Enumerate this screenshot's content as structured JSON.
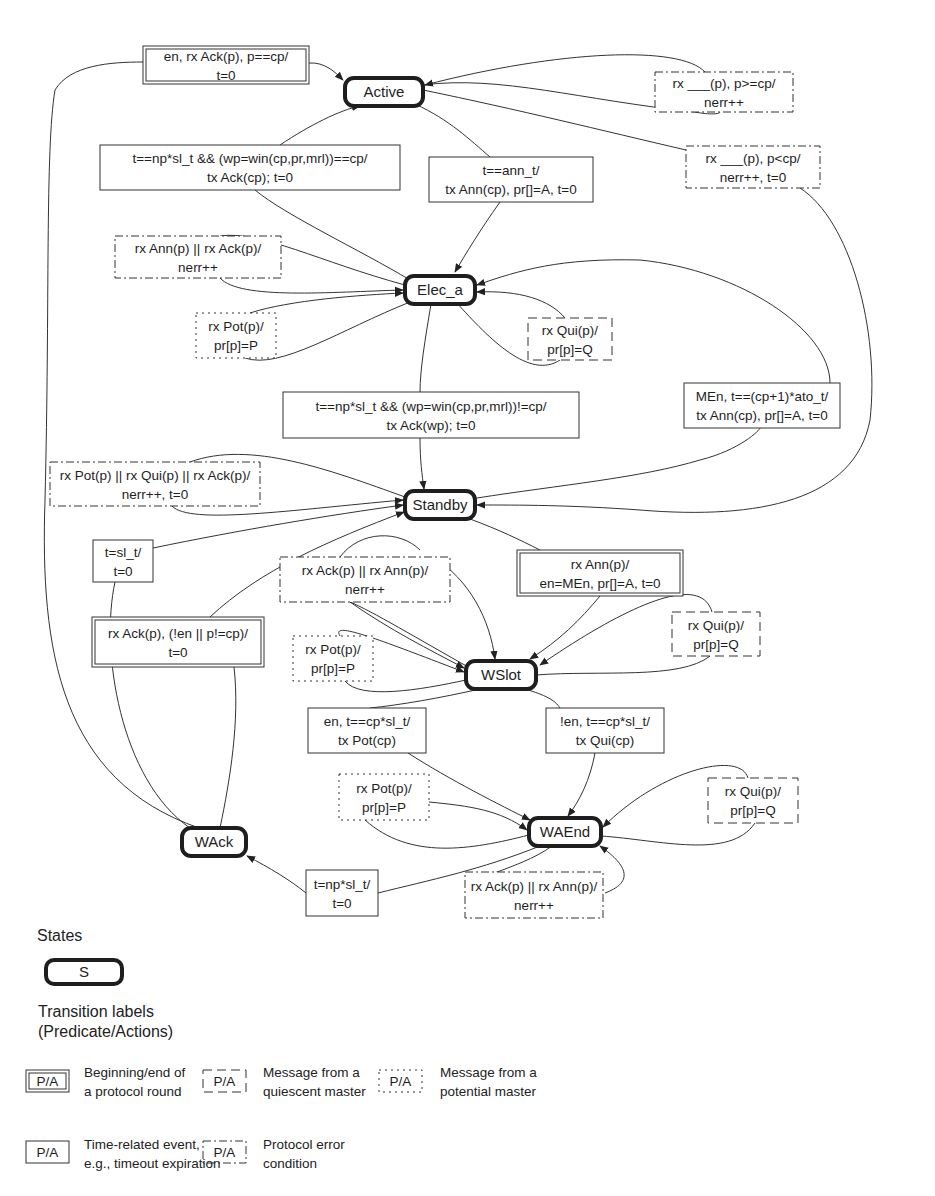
{
  "states": [
    {
      "id": "active",
      "label": "Active",
      "x": 345,
      "y": 78,
      "w": 78,
      "h": 28
    },
    {
      "id": "elec_a",
      "label": "Elec_a",
      "x": 405,
      "y": 276,
      "w": 70,
      "h": 28
    },
    {
      "id": "standby",
      "label": "Standby",
      "x": 405,
      "y": 491,
      "w": 70,
      "h": 28
    },
    {
      "id": "wslot",
      "label": "WSlot",
      "x": 466,
      "y": 661,
      "w": 70,
      "h": 28
    },
    {
      "id": "wack",
      "label": "WAck",
      "x": 182,
      "y": 828,
      "w": 64,
      "h": 28
    },
    {
      "id": "waend",
      "label": "WAEnd",
      "x": 529,
      "y": 818,
      "w": 72,
      "h": 28
    }
  ],
  "labels": [
    {
      "id": "en-rx-ack",
      "style": "double",
      "x": 143,
      "y": 46,
      "w": 166,
      "h": 38,
      "lines": [
        "en, rx Ack(p), p==cp/",
        "t=0"
      ]
    },
    {
      "id": "rx-p-ge-cp",
      "style": "dashdot",
      "x": 655,
      "y": 72,
      "w": 138,
      "h": 40,
      "lines": [
        "rx ___(p), p>=cp/",
        "nerr++"
      ]
    },
    {
      "id": "win-eq-cp",
      "style": "solid",
      "x": 100,
      "y": 145,
      "w": 300,
      "h": 45,
      "lines": [
        "t==np*sl_t && (wp=win(cp,pr,mrl))==cp/",
        "tx Ack(cp); t=0"
      ]
    },
    {
      "id": "ann-t",
      "style": "solid",
      "x": 429,
      "y": 157,
      "w": 164,
      "h": 45,
      "lines": [
        "t==ann_t/",
        "tx Ann(cp), pr[]=A, t=0"
      ]
    },
    {
      "id": "rx-p-lt-cp",
      "style": "dashdot",
      "x": 686,
      "y": 146,
      "w": 134,
      "h": 42,
      "lines": [
        "rx ___(p), p<cp/",
        "nerr++, t=0"
      ]
    },
    {
      "id": "ann-or-ack",
      "style": "dashdot",
      "x": 115,
      "y": 236,
      "w": 166,
      "h": 42,
      "lines": [
        "rx Ann(p) || rx Ack(p)/",
        "nerr++"
      ]
    },
    {
      "id": "pot-elec",
      "style": "dotted",
      "x": 196,
      "y": 313,
      "w": 80,
      "h": 45,
      "lines": [
        "rx Pot(p)/",
        "pr[p]=P"
      ]
    },
    {
      "id": "qui-elec",
      "style": "dashed",
      "x": 528,
      "y": 318,
      "w": 84,
      "h": 42,
      "lines": [
        "rx Qui(p)/",
        "pr[p]=Q"
      ]
    },
    {
      "id": "win-ne-cp",
      "style": "solid",
      "x": 283,
      "y": 392,
      "w": 296,
      "h": 46,
      "lines": [
        "t==np*sl_t && (wp=win(cp,pr,mrl))!=cp/",
        "tx Ack(wp); t=0"
      ]
    },
    {
      "id": "men-ato",
      "style": "solid",
      "x": 684,
      "y": 383,
      "w": 156,
      "h": 45,
      "lines": [
        "MEn, t==(cp+1)*ato_t/",
        "tx Ann(cp), pr[]=A, t=0"
      ]
    },
    {
      "id": "pot-qui-ack",
      "style": "dashdot",
      "x": 50,
      "y": 462,
      "w": 210,
      "h": 44,
      "lines": [
        "rx Pot(p) || rx Qui(p) || rx Ack(p)/",
        "nerr++, t=0"
      ]
    },
    {
      "id": "sl-t",
      "style": "solid",
      "x": 93,
      "y": 540,
      "w": 60,
      "h": 42,
      "lines": [
        "t=sl_t/",
        "t=0"
      ]
    },
    {
      "id": "rx-ann",
      "style": "double",
      "x": 517,
      "y": 550,
      "w": 166,
      "h": 46,
      "lines": [
        "rx Ann(p)/",
        "en=MEn, pr[]=A, t=0"
      ]
    },
    {
      "id": "ack-ann-wslot",
      "style": "dashdot",
      "x": 280,
      "y": 557,
      "w": 170,
      "h": 45,
      "lines": [
        "rx Ack(p) || rx Ann(p)/",
        "nerr++"
      ]
    },
    {
      "id": "rx-ack-en",
      "style": "double",
      "x": 92,
      "y": 617,
      "w": 172,
      "h": 50,
      "lines": [
        "rx Ack(p), (!en || p!=cp)/",
        "t=0"
      ]
    },
    {
      "id": "qui-wslot",
      "style": "dashed",
      "x": 672,
      "y": 612,
      "w": 88,
      "h": 44,
      "lines": [
        "rx Qui(p)/",
        "pr[p]=Q"
      ]
    },
    {
      "id": "pot-wslot",
      "style": "dotted",
      "x": 293,
      "y": 636,
      "w": 80,
      "h": 45,
      "lines": [
        "rx Pot(p)/",
        "pr[p]=P"
      ]
    },
    {
      "id": "en-pot",
      "style": "solid",
      "x": 308,
      "y": 708,
      "w": 118,
      "h": 45,
      "lines": [
        "en, t==cp*sl_t/",
        "tx Pot(cp)"
      ]
    },
    {
      "id": "nen-qui",
      "style": "solid",
      "x": 546,
      "y": 708,
      "w": 118,
      "h": 45,
      "lines": [
        "!en, t==cp*sl_t/",
        "tx Qui(cp)"
      ]
    },
    {
      "id": "pot-waend",
      "style": "dotted",
      "x": 339,
      "y": 774,
      "w": 90,
      "h": 46,
      "lines": [
        "rx Pot(p)/",
        "pr[p]=P"
      ]
    },
    {
      "id": "qui-waend",
      "style": "dashed",
      "x": 708,
      "y": 778,
      "w": 90,
      "h": 45,
      "lines": [
        "rx Qui(p)/",
        "pr[p]=Q"
      ]
    },
    {
      "id": "np-sl-t",
      "style": "solid",
      "x": 306,
      "y": 870,
      "w": 72,
      "h": 46,
      "lines": [
        "t=np*sl_t/",
        "t=0"
      ]
    },
    {
      "id": "ack-ann-waend",
      "style": "dashdot",
      "x": 465,
      "y": 872,
      "w": 138,
      "h": 46,
      "lines": [
        "rx Ack(p) || rx Ann(p)/",
        "nerr++"
      ]
    }
  ],
  "legend": {
    "states_heading": "States",
    "state_sample": "S",
    "transitions_heading": "Transition labels",
    "transitions_sub": "(Predicate/Actions)",
    "items": [
      {
        "style": "double",
        "sample": "P/A",
        "desc": [
          "Beginning/end of",
          "a protocol round"
        ]
      },
      {
        "style": "dashed",
        "sample": "P/A",
        "desc": [
          "Message from a",
          "quiescent master"
        ]
      },
      {
        "style": "dotted",
        "sample": "P/A",
        "desc": [
          "Message from a",
          "potential master"
        ]
      },
      {
        "style": "solid",
        "sample": "P/A",
        "desc": [
          "Time-related event,",
          "e.g., timeout expiration"
        ]
      },
      {
        "style": "dashdot",
        "sample": "P/A",
        "desc": [
          "Protocol error",
          "condition"
        ]
      }
    ]
  },
  "colors": {
    "ink": "#1e1e1e",
    "line": "#333333",
    "background": "#ffffff"
  }
}
